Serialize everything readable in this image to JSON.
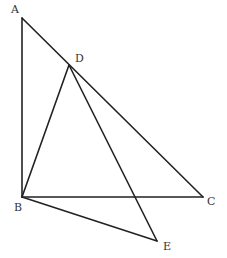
{
  "diagram": {
    "points": {
      "A": {
        "label": "A",
        "x": 22,
        "y": 18,
        "lx": 11,
        "ly": 13
      },
      "B": {
        "label": "B",
        "x": 22,
        "y": 197,
        "lx": 14,
        "ly": 211
      },
      "C": {
        "label": "C",
        "x": 203,
        "y": 197,
        "lx": 207,
        "ly": 205
      },
      "D": {
        "label": "D",
        "x": 69,
        "y": 65,
        "lx": 75,
        "ly": 62
      },
      "E": {
        "label": "E",
        "x": 157,
        "y": 241,
        "lx": 163,
        "ly": 250
      }
    },
    "segments": [
      "AB",
      "AC",
      "BC",
      "BD",
      "DE",
      "BE"
    ]
  }
}
